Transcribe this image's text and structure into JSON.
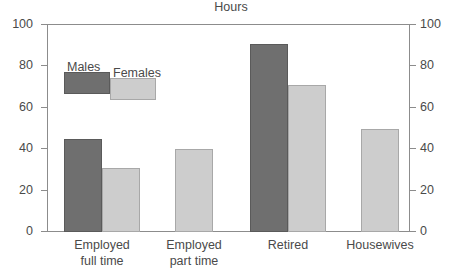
{
  "chart_data": {
    "type": "bar",
    "title": "Hours",
    "xlabel": "",
    "ylabel": "",
    "ylim": [
      0,
      100
    ],
    "yticks": [
      0,
      20,
      40,
      60,
      80,
      100
    ],
    "ytick_labels": [
      "0",
      "20",
      "40",
      "60",
      "80",
      "100"
    ],
    "right_axis": true,
    "right_ytick_labels": [
      "0",
      "20",
      "40",
      "60",
      "80",
      "100"
    ],
    "grid": false,
    "legend_position": "upper-left-inside",
    "categories": [
      "Employed\nfull time",
      "Employed\npart time",
      "Retired",
      "Housewives"
    ],
    "series": [
      {
        "name": "Males",
        "color": "#6f6f6f",
        "values": [
          45,
          null,
          91,
          null
        ]
      },
      {
        "name": "Females",
        "color": "#cdcdcd",
        "values": [
          31,
          40,
          71,
          50
        ]
      }
    ]
  },
  "axis": {
    "left_ticks": [
      {
        "label": "100",
        "value": 100
      },
      {
        "label": "80",
        "value": 80
      },
      {
        "label": "60",
        "value": 60
      },
      {
        "label": "40",
        "value": 40
      },
      {
        "label": "20",
        "value": 20
      },
      {
        "label": "0",
        "value": 0
      }
    ],
    "right_ticks": [
      {
        "label": "100",
        "value": 100
      },
      {
        "label": "80",
        "value": 80
      },
      {
        "label": "60",
        "value": 60
      },
      {
        "label": "40",
        "value": 40
      },
      {
        "label": "20",
        "value": 20
      },
      {
        "label": "0",
        "value": 0
      }
    ]
  },
  "legend": {
    "males_label": "Males",
    "females_label": "Females"
  },
  "categories": [
    {
      "label": "Employed\nfull time"
    },
    {
      "label": "Employed\npart time"
    },
    {
      "label": "Retired"
    },
    {
      "label": "Housewives"
    }
  ],
  "title": "Hours",
  "colors": {
    "male": "#6f6f6f",
    "male_border": "#5a5a5a",
    "female": "#cdcdcd",
    "female_border": "#a8a8a8",
    "axis": "#8c8c8c",
    "text": "#4a4a4a",
    "background": "#ffffff"
  }
}
